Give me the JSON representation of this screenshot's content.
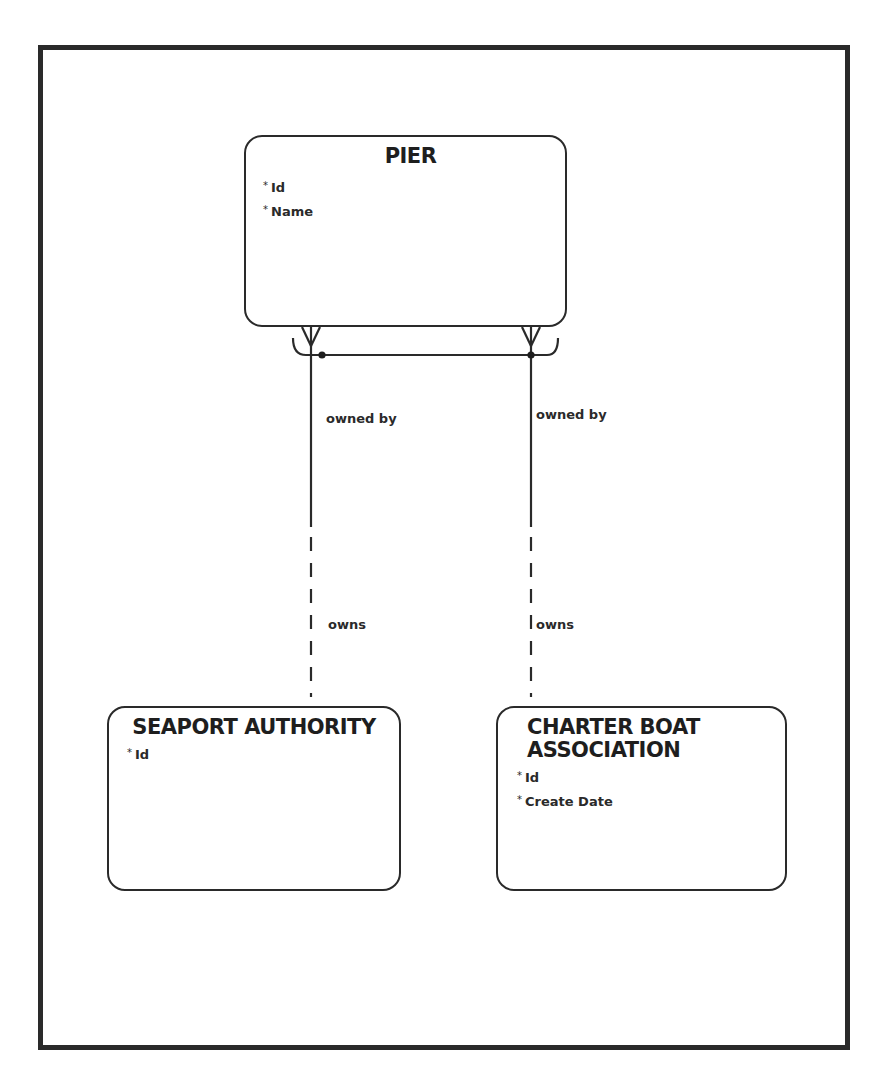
{
  "diagram": {
    "type": "entity-relationship",
    "entities": [
      {
        "name": "PIER",
        "attributes": [
          {
            "mandatory": "*",
            "name": "Id"
          },
          {
            "mandatory": "*",
            "name": "Name"
          }
        ]
      },
      {
        "name": "SEAPORT AUTHORITY",
        "attributes": [
          {
            "mandatory": "*",
            "name": "Id"
          }
        ]
      },
      {
        "name_line1": "CHARTER BOAT",
        "name_line2": "ASSOCIATION",
        "attributes": [
          {
            "mandatory": "*",
            "name": "Id"
          },
          {
            "mandatory": "*",
            "name": "Create Date"
          }
        ]
      }
    ],
    "relationships": [
      {
        "from": "PIER",
        "to": "SEAPORT AUTHORITY",
        "from_label": "owned by",
        "to_label": "owns",
        "from_cardinality": "many (mandatory)",
        "to_cardinality": "one (optional)"
      },
      {
        "from": "PIER",
        "to": "CHARTER BOAT ASSOCIATION",
        "from_label": "owned by",
        "to_label": "owns",
        "from_cardinality": "many (mandatory)",
        "to_cardinality": "one (optional)"
      }
    ],
    "arc": "exclusive arc across both PIER relationships"
  }
}
